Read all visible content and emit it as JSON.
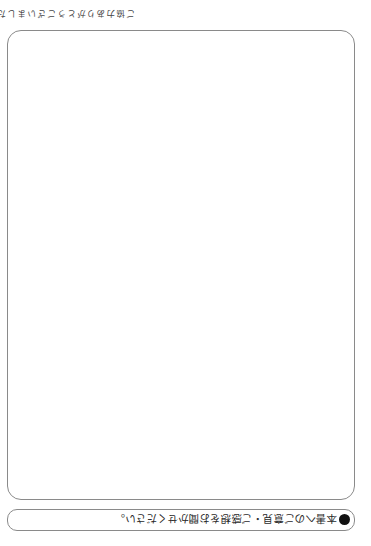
{
  "page": {
    "orientation": "rotated-180",
    "comment_prompt": {
      "bullet": "black-circle",
      "text": "本書へのご意見・ご感想をお聞かせください。"
    },
    "comment_area": {
      "content": ""
    },
    "closing_note": "ご協力ありがとうございました。"
  },
  "colors": {
    "border": "#8a8a8a",
    "text": "#2a2a2a",
    "background": "#ffffff"
  }
}
